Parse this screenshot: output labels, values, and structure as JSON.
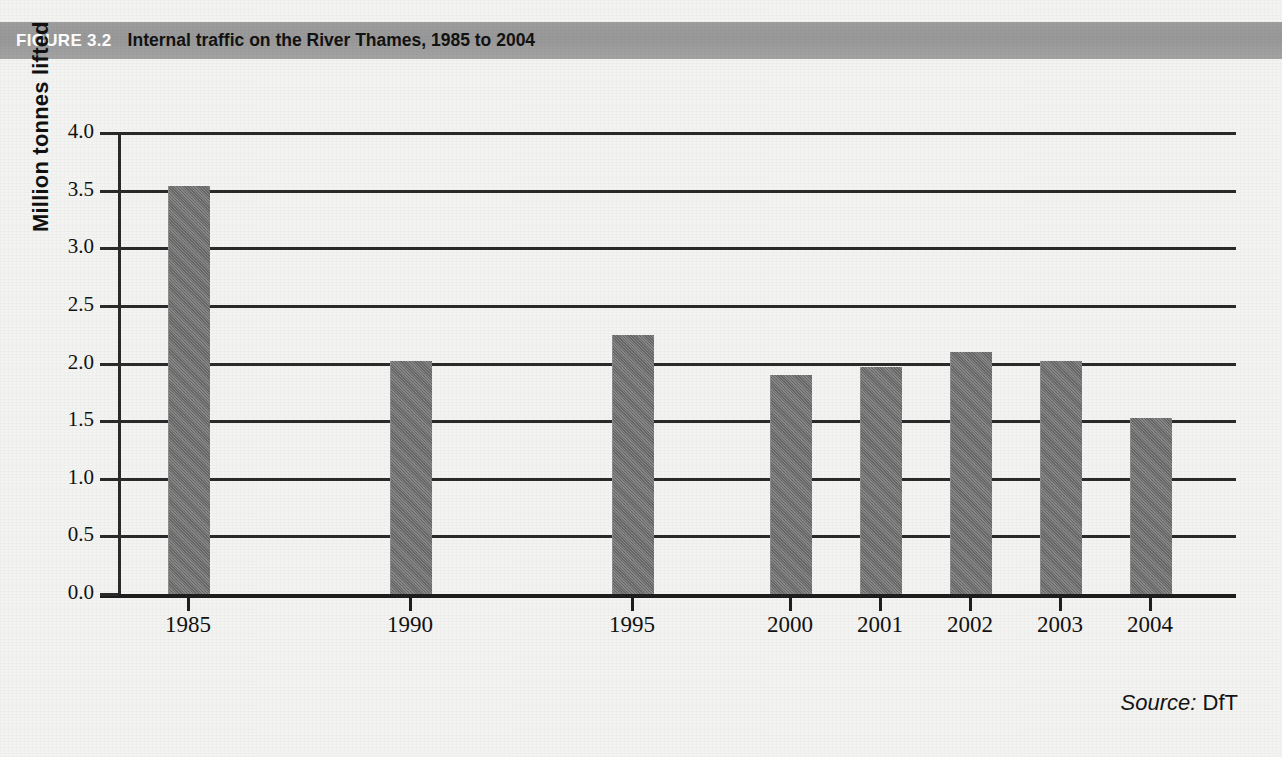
{
  "figure": {
    "tag": "FIGURE 3.2",
    "title": "Internal traffic on the River Thames, 1985 to 2004",
    "banner_color": "#9a9a9a",
    "source_word": "Source:",
    "source_value": "DfT"
  },
  "chart_data": {
    "type": "bar",
    "title": "Internal traffic on the River Thames, 1985 to 2004",
    "xlabel": "",
    "ylabel": "Million tonnes lifted",
    "categories": [
      "1985",
      "1990",
      "1995",
      "2000",
      "2001",
      "2002",
      "2003",
      "2004"
    ],
    "values": [
      3.54,
      2.02,
      2.25,
      1.9,
      1.97,
      2.1,
      2.02,
      1.53
    ],
    "ylim": [
      0.0,
      4.0
    ],
    "ytick_labels": [
      "0.0",
      "0.5",
      "1.0",
      "1.5",
      "2.0",
      "2.5",
      "3.0",
      "3.5",
      "4.0"
    ],
    "ytick_values": [
      0.0,
      0.5,
      1.0,
      1.5,
      2.0,
      2.5,
      3.0,
      3.5,
      4.0
    ],
    "grid": true,
    "legend": false,
    "bar_color": "#737373",
    "units": "Million tonnes lifted"
  }
}
